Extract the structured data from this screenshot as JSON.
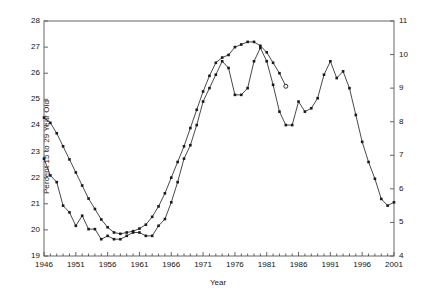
{
  "chart_data": {
    "type": "line",
    "title": "",
    "xlabel": "Year",
    "ylabel": "Percent 15 to 29 Year Old",
    "ylabel_right": "Murder Rate",
    "xlim": [
      1946,
      2001
    ],
    "ylim": [
      19,
      28
    ],
    "ylim_right": [
      4,
      11
    ],
    "xticks": [
      1946,
      1951,
      1956,
      1961,
      1966,
      1971,
      1976,
      1981,
      1986,
      1991,
      1996,
      2001
    ],
    "yticks_left": [
      19,
      20,
      21,
      22,
      23,
      24,
      25,
      26,
      27,
      28
    ],
    "yticks_right": [
      4,
      5,
      6,
      7,
      8,
      9,
      10,
      11
    ],
    "xtick_minor_step": 1,
    "grid": false,
    "legend": "none",
    "marker": "filled-square",
    "series": [
      {
        "name": "Percent 15 to 29 Year Old",
        "axis": "left",
        "marker_end": "open-circle",
        "x": [
          1946,
          1947,
          1948,
          1949,
          1950,
          1951,
          1952,
          1953,
          1954,
          1955,
          1956,
          1957,
          1958,
          1959,
          1960,
          1961,
          1962,
          1963,
          1964,
          1965,
          1966,
          1967,
          1968,
          1969,
          1970,
          1971,
          1972,
          1973,
          1974,
          1975,
          1976,
          1977,
          1978,
          1979,
          1980,
          1981,
          1982,
          1983,
          1984
        ],
        "y": [
          24.3,
          24.1,
          23.7,
          23.2,
          22.7,
          22.2,
          21.7,
          21.2,
          20.8,
          20.4,
          20.1,
          19.9,
          19.85,
          19.9,
          19.95,
          20.05,
          20.2,
          20.5,
          20.9,
          21.4,
          22.0,
          22.6,
          23.2,
          23.9,
          24.6,
          25.3,
          25.9,
          26.4,
          26.6,
          26.7,
          27.0,
          27.1,
          27.2,
          27.2,
          27.05,
          26.8,
          26.4,
          26.0,
          25.5
        ]
      },
      {
        "name": "Murder Rate",
        "axis": "right",
        "marker_end": "filled-square",
        "x": [
          1946,
          1947,
          1948,
          1949,
          1950,
          1951,
          1952,
          1953,
          1954,
          1955,
          1956,
          1957,
          1958,
          1959,
          1960,
          1961,
          1962,
          1963,
          1964,
          1965,
          1966,
          1967,
          1968,
          1969,
          1970,
          1971,
          1972,
          1973,
          1974,
          1975,
          1976,
          1977,
          1978,
          1979,
          1980,
          1981,
          1982,
          1983,
          1984,
          1985,
          1986,
          1987,
          1988,
          1989,
          1990,
          1991,
          1992,
          1993,
          1994,
          1995,
          1996,
          1997,
          1998,
          1999,
          2000,
          2001
        ],
        "y": [
          6.9,
          6.4,
          6.2,
          5.5,
          5.3,
          4.9,
          5.2,
          4.8,
          4.8,
          4.5,
          4.6,
          4.5,
          4.5,
          4.6,
          4.7,
          4.7,
          4.6,
          4.6,
          4.9,
          5.1,
          5.6,
          6.2,
          6.9,
          7.3,
          7.9,
          8.6,
          9.0,
          9.4,
          9.8,
          9.6,
          8.8,
          8.8,
          9.0,
          9.8,
          10.2,
          9.8,
          9.1,
          8.3,
          7.9,
          7.9,
          8.6,
          8.3,
          8.4,
          8.7,
          9.4,
          9.8,
          9.3,
          9.5,
          9.0,
          8.2,
          7.4,
          6.8,
          6.3,
          5.7,
          5.5,
          5.6
        ]
      }
    ]
  },
  "axes": {
    "xlabel": "Year",
    "ylabel_left": "Percent 15 to 29 Year Old",
    "ylabel_right": "Murder Rate"
  }
}
